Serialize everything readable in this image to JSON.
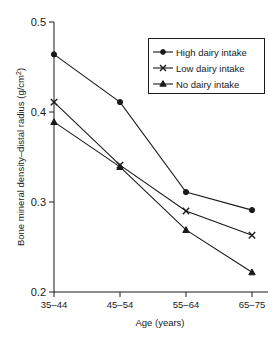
{
  "chart_data": {
    "type": "line",
    "title": "",
    "xlabel": "Age (years)",
    "ylabel": "Bone mineral density–distal radius (g/cm²)",
    "categories": [
      "35–44",
      "45–54",
      "55–64",
      "65–75"
    ],
    "ylim": [
      0.2,
      0.5
    ],
    "yticks": [
      0.2,
      0.3,
      0.4,
      0.5
    ],
    "ytick_labels": [
      "0.2",
      "0.3",
      "0.4",
      "0.5"
    ],
    "grid": false,
    "legend_position": "top-right",
    "series": [
      {
        "name": "High dairy intake",
        "marker": "filled-circle",
        "values": [
          0.464,
          0.411,
          0.311,
          0.291
        ]
      },
      {
        "name": "Low dairy intake",
        "marker": "x-cross",
        "values": [
          0.411,
          0.341,
          0.29,
          0.263
        ]
      },
      {
        "name": "No dairy intake",
        "marker": "filled-triangle",
        "values": [
          0.389,
          0.339,
          0.269,
          0.222
        ]
      }
    ]
  },
  "axes": {
    "y_title_text": "Bone mineral density–distal radius (g/cm",
    "y_title_sup": "2",
    "y_title_tail": ")",
    "x_title": "Age (years)"
  },
  "legend": {
    "entries": [
      {
        "label": "High dairy intake"
      },
      {
        "label": "Low dairy intake"
      },
      {
        "label": "No dairy intake"
      }
    ]
  },
  "colors": {
    "ink": "#1a1a1a",
    "background": "#ffffff"
  }
}
